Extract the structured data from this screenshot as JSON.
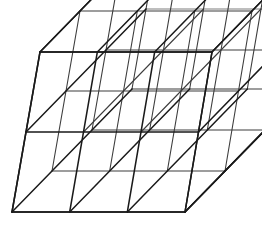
{
  "figure": {
    "kind": "line-drawing",
    "background_color": "#ffffff",
    "stroke_color": "#1a1a1a",
    "faint_stroke_color": "#7d7d7d",
    "canvas": {
      "width": 262,
      "height": 228
    }
  },
  "geometry": {
    "description": "Oblique (cavalier) projection of a rectangular box subdivided into a 3 x 2 x 3 lattice of cubic cells.",
    "divisions": {
      "x": 3,
      "y": 2,
      "z": 3
    },
    "front_face_corners": {
      "top_left": [
        40,
        52
      ],
      "top_right": [
        212,
        52
      ],
      "bottom_right": [
        185,
        212
      ],
      "bottom_left": [
        12,
        212
      ]
    },
    "depth_offset": {
      "dx": 40,
      "dy": -41
    },
    "front_width": 172,
    "front_height": 160,
    "front_shear_dx": -28,
    "labels": {
      "top_back_left": [
        80,
        11
      ],
      "top_back_right": [
        252,
        11
      ],
      "bottom_back_right": [
        225,
        171
      ],
      "bottom_back_left": [
        52,
        171
      ]
    }
  },
  "legend": {
    "near_edges_label": "near (dark) edges",
    "far_edges_label": "far (light) edges"
  }
}
